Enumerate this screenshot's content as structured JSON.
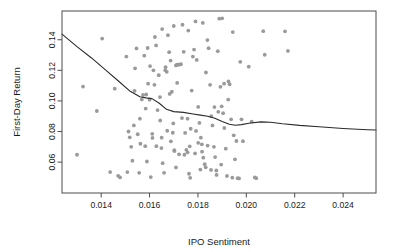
{
  "chart_data": {
    "type": "scatter",
    "title": "",
    "subtitle": "",
    "xlabel": "IPO Sentiment",
    "ylabel": "First-Day Return",
    "xlim": [
      0.01238,
      0.02536
    ],
    "ylim": [
      0.0398,
      0.1588
    ],
    "xticks": [
      0.014,
      0.016,
      0.018,
      0.02,
      0.022,
      0.024
    ],
    "xtick_labels": [
      "0.014",
      "0.016",
      "0.018",
      "0.020",
      "0.022",
      "0.024"
    ],
    "yticks": [
      0.06,
      0.08,
      0.1,
      0.12,
      0.14
    ],
    "ytick_labels": [
      "0.06",
      "0.08",
      "0.10",
      "0.12",
      "0.14"
    ],
    "grid": false,
    "legend": "none",
    "point_color": "#9a9a9a",
    "point_radius": 1.9,
    "line_color": "#2b2b2b",
    "line_width": 1.1,
    "axis_color": "#4d4d4d",
    "background": "#ffffff",
    "series": [
      {
        "name": "IPOs",
        "type": "scatter",
        "points": [
          [
            0.01404,
            0.1408
          ],
          [
            0.01325,
            0.1094
          ],
          [
            0.013,
            0.0648
          ],
          [
            0.01382,
            0.0934
          ],
          [
            0.01437,
            0.0535
          ],
          [
            0.0147,
            0.051
          ],
          [
            0.01508,
            0.0535
          ],
          [
            0.01513,
            0.08
          ],
          [
            0.01518,
            0.0762
          ],
          [
            0.01524,
            0.07
          ],
          [
            0.01529,
            0.0609
          ],
          [
            0.01535,
            0.084
          ],
          [
            0.0154,
            0.1213
          ],
          [
            0.01546,
            0.1343
          ],
          [
            0.01551,
            0.0782
          ],
          [
            0.01557,
            0.053
          ],
          [
            0.01562,
            0.072
          ],
          [
            0.01568,
            0.101
          ],
          [
            0.01573,
            0.1039
          ],
          [
            0.01578,
            0.1296
          ],
          [
            0.01584,
            0.095
          ],
          [
            0.01589,
            0.0604
          ],
          [
            0.01594,
            0.1113
          ],
          [
            0.016,
            0.1008
          ],
          [
            0.01605,
            0.0502
          ],
          [
            0.01611,
            0.0785
          ],
          [
            0.01616,
            0.12
          ],
          [
            0.01622,
            0.1418
          ],
          [
            0.01627,
            0.1363
          ],
          [
            0.01633,
            0.094
          ],
          [
            0.01638,
            0.1168
          ],
          [
            0.01643,
            0.1025
          ],
          [
            0.01649,
            0.0692
          ],
          [
            0.01654,
            0.0593
          ],
          [
            0.0166,
            0.053
          ],
          [
            0.01665,
            0.12
          ],
          [
            0.01671,
            0.119
          ],
          [
            0.01676,
            0.143
          ],
          [
            0.01681,
            0.1319
          ],
          [
            0.01687,
            0.1264
          ],
          [
            0.01692,
            0.106
          ],
          [
            0.01698,
            0.0853
          ],
          [
            0.01703,
            0.0672
          ],
          [
            0.01709,
            0.0565
          ],
          [
            0.01714,
            0.1118
          ],
          [
            0.01719,
            0.1238
          ],
          [
            0.01725,
            0.1238
          ],
          [
            0.0173,
            0.124
          ],
          [
            0.01736,
            0.1498
          ],
          [
            0.01741,
            0.1321
          ],
          [
            0.01747,
            0.0791
          ],
          [
            0.01752,
            0.068
          ],
          [
            0.01757,
            0.0664
          ],
          [
            0.01763,
            0.0524
          ],
          [
            0.01768,
            0.0497
          ],
          [
            0.01774,
            0.1068
          ],
          [
            0.01779,
            0.129
          ],
          [
            0.01784,
            0.1336
          ],
          [
            0.0179,
            0.152
          ],
          [
            0.01795,
            0.1268
          ],
          [
            0.01801,
            0.0961
          ],
          [
            0.01806,
            0.0856
          ],
          [
            0.01812,
            0.076
          ],
          [
            0.01817,
            0.0668
          ],
          [
            0.01822,
            0.0629
          ],
          [
            0.01828,
            0.0586
          ],
          [
            0.01833,
            0.1186
          ],
          [
            0.01839,
            0.1398
          ],
          [
            0.01844,
            0.1345
          ],
          [
            0.0185,
            0.1105
          ],
          [
            0.01855,
            0.09
          ],
          [
            0.0186,
            0.084
          ],
          [
            0.01866,
            0.07
          ],
          [
            0.01871,
            0.0633
          ],
          [
            0.01877,
            0.0516
          ],
          [
            0.01882,
            0.1325
          ],
          [
            0.01888,
            0.1538
          ],
          [
            0.01893,
            0.1092
          ],
          [
            0.01898,
            0.0965
          ],
          [
            0.01904,
            0.092
          ],
          [
            0.01909,
            0.0823
          ],
          [
            0.01915,
            0.0688
          ],
          [
            0.0192,
            0.0509
          ],
          [
            0.01926,
            0.1127
          ],
          [
            0.01931,
            0.1109
          ],
          [
            0.01937,
            0.088
          ],
          [
            0.01942,
            0.0498
          ],
          [
            0.01948,
            0.0775
          ],
          [
            0.01953,
            0.0618
          ],
          [
            0.01959,
            0.0738
          ],
          [
            0.01964,
            0.0495
          ],
          [
            0.0197,
            0.0493
          ],
          [
            0.01975,
            0.1256
          ],
          [
            0.0198,
            0.088
          ],
          [
            0.01986,
            0.0737
          ],
          [
            0.0201,
            0.1224
          ],
          [
            0.02022,
            0.0865
          ],
          [
            0.02035,
            0.05
          ],
          [
            0.02041,
            0.0495
          ],
          [
            0.0207,
            0.1456
          ],
          [
            0.02076,
            0.1302
          ],
          [
            0.0216,
            0.1455
          ],
          [
            0.02172,
            0.1327
          ],
          [
            0.01456,
            0.108
          ],
          [
            0.0162,
            0.1105
          ],
          [
            0.01586,
            0.1042
          ],
          [
            0.01602,
            0.1228
          ],
          [
            0.01666,
            0.1221
          ],
          [
            0.01709,
            0.1232
          ],
          [
            0.01713,
            0.1237
          ],
          [
            0.01683,
            0.1046
          ],
          [
            0.01644,
            0.0872
          ],
          [
            0.01673,
            0.0805
          ],
          [
            0.01696,
            0.0792
          ],
          [
            0.01734,
            0.0888
          ],
          [
            0.01757,
            0.0884
          ],
          [
            0.0177,
            0.0818
          ],
          [
            0.01792,
            0.0804
          ],
          [
            0.01801,
            0.0726
          ],
          [
            0.01816,
            0.0716
          ],
          [
            0.0184,
            0.0708
          ],
          [
            0.01868,
            0.096
          ],
          [
            0.01884,
            0.0929
          ],
          [
            0.01908,
            0.1113
          ],
          [
            0.01925,
            0.1009
          ],
          [
            0.01538,
            0.1066
          ],
          [
            0.0156,
            0.0884
          ],
          [
            0.01582,
            0.0704
          ],
          [
            0.01612,
            0.0758
          ],
          [
            0.01628,
            0.0704
          ],
          [
            0.0165,
            0.076
          ],
          [
            0.01688,
            0.0736
          ],
          [
            0.01702,
            0.0678
          ],
          [
            0.01722,
            0.0651
          ],
          [
            0.01744,
            0.0648
          ],
          [
            0.01766,
            0.0703
          ],
          [
            0.01788,
            0.0657
          ],
          [
            0.0181,
            0.0551
          ],
          [
            0.01832,
            0.0566
          ],
          [
            0.01854,
            0.0549
          ],
          [
            0.01876,
            0.0545
          ],
          [
            0.01896,
            0.0584
          ],
          [
            0.01478,
            0.05
          ],
          [
            0.01504,
            0.129
          ],
          [
            0.01592,
            0.1346
          ],
          [
            0.01652,
            0.147
          ],
          [
            0.017,
            0.149
          ],
          [
            0.0176,
            0.146
          ],
          [
            0.0182,
            0.151
          ],
          [
            0.019,
            0.154
          ],
          [
            0.01944,
            0.145
          ]
        ]
      },
      {
        "name": "LOESS smooth",
        "type": "line",
        "points": [
          [
            0.01238,
            0.1437
          ],
          [
            0.013,
            0.1355
          ],
          [
            0.0136,
            0.1281
          ],
          [
            0.0142,
            0.12
          ],
          [
            0.0147,
            0.1132
          ],
          [
            0.0152,
            0.1063
          ],
          [
            0.0156,
            0.1027
          ],
          [
            0.01585,
            0.102
          ],
          [
            0.0161,
            0.1015
          ],
          [
            0.0164,
            0.0985
          ],
          [
            0.0167,
            0.0945
          ],
          [
            0.017,
            0.093
          ],
          [
            0.0174,
            0.0925
          ],
          [
            0.0178,
            0.0915
          ],
          [
            0.0181,
            0.0907
          ],
          [
            0.0184,
            0.09
          ],
          [
            0.0187,
            0.0887
          ],
          [
            0.019,
            0.0866
          ],
          [
            0.0193,
            0.0848
          ],
          [
            0.01955,
            0.0841
          ],
          [
            0.0198,
            0.0845
          ],
          [
            0.0201,
            0.0854
          ],
          [
            0.0206,
            0.0863
          ],
          [
            0.021,
            0.0861
          ],
          [
            0.0215,
            0.0851
          ],
          [
            0.0222,
            0.084
          ],
          [
            0.023,
            0.0831
          ],
          [
            0.024,
            0.082
          ],
          [
            0.025,
            0.0812
          ],
          [
            0.02536,
            0.081
          ]
        ]
      }
    ]
  }
}
